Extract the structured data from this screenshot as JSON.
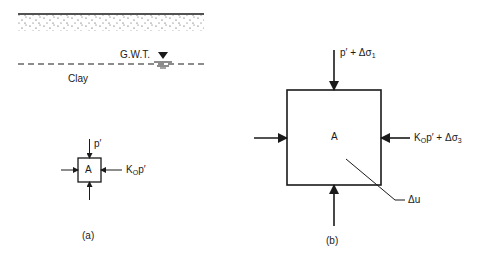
{
  "panel_a": {
    "gwt_label": "G.W.T.",
    "soil_label": "Clay",
    "element_label": "A",
    "vertical_stress": "p′",
    "horizontal_stress_prefix": "K",
    "horizontal_stress_sub": "O",
    "horizontal_stress_suffix": "p′",
    "caption": "(a)"
  },
  "panel_b": {
    "element_label": "A",
    "vertical_stress_prefix": "p′ + Δσ",
    "vertical_stress_sub": "1",
    "horizontal_stress_prefix": "K",
    "horizontal_stress_sub": "O",
    "horizontal_stress_mid": "p′ + Δσ",
    "horizontal_stress_sub2": "3",
    "pore_pressure_label": "Δu",
    "caption": "(b)"
  },
  "colors": {
    "ink": "#1a1a1a",
    "background": "#ffffff"
  }
}
